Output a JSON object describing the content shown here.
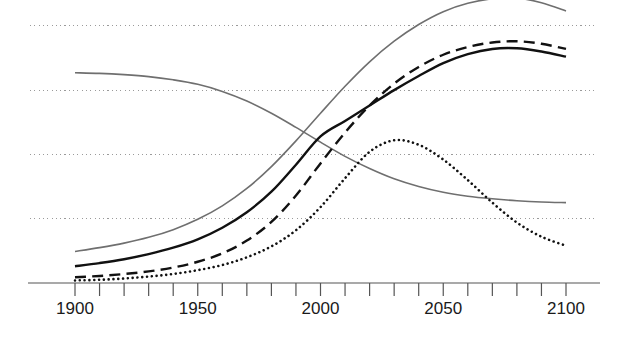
{
  "chart_data": {
    "type": "line",
    "title": "",
    "subtitle": "",
    "xlabel": "",
    "ylabel": "",
    "xlim": [
      1900,
      2100
    ],
    "ylim": [
      0,
      5
    ],
    "grid": "horizontal-dotted",
    "legend": "none",
    "x_ticks_major": [
      1900,
      1950,
      2000,
      2050,
      2100
    ],
    "x_tick_labels": [
      "1900",
      "1950",
      "2000",
      "2050",
      "2100"
    ],
    "x_ticks_minor_step": 10,
    "y_gridlines": [
      1,
      2,
      3,
      4
    ],
    "y_tick_labels": [],
    "colors": {
      "axis": "#555555",
      "grid": "#9a9a9a",
      "gray_line": "#6f6f6f",
      "black_line": "#111111",
      "background": "#ffffff"
    },
    "x": [
      1900,
      1910,
      1920,
      1930,
      1940,
      1950,
      1960,
      1970,
      1980,
      1990,
      2000,
      2010,
      2020,
      2030,
      2040,
      2050,
      2060,
      2070,
      2080,
      2090,
      2100
    ],
    "series": [
      {
        "name": "rising-gray-upper",
        "style": "solid",
        "color": "#6f6f6f",
        "width": 1.6,
        "values": [
          0.49,
          0.55,
          0.62,
          0.71,
          0.83,
          0.99,
          1.2,
          1.47,
          1.81,
          2.21,
          2.64,
          3.06,
          3.44,
          3.76,
          4.02,
          4.22,
          4.35,
          4.42,
          4.43,
          4.36,
          4.23
        ]
      },
      {
        "name": "declining-gray",
        "style": "solid",
        "color": "#6f6f6f",
        "width": 1.6,
        "values": [
          3.27,
          3.26,
          3.24,
          3.21,
          3.16,
          3.09,
          2.98,
          2.83,
          2.64,
          2.42,
          2.19,
          1.97,
          1.78,
          1.62,
          1.5,
          1.41,
          1.35,
          1.31,
          1.28,
          1.26,
          1.25
        ]
      },
      {
        "name": "solid-black",
        "style": "solid",
        "color": "#111111",
        "width": 2.4,
        "values": [
          0.26,
          0.31,
          0.37,
          0.45,
          0.55,
          0.68,
          0.86,
          1.1,
          1.42,
          1.84,
          2.28,
          2.52,
          2.76,
          3.0,
          3.22,
          3.42,
          3.56,
          3.64,
          3.65,
          3.6,
          3.52
        ]
      },
      {
        "name": "dashed-black",
        "style": "dashed",
        "color": "#111111",
        "width": 2.4,
        "values": [
          0.09,
          0.11,
          0.14,
          0.18,
          0.24,
          0.33,
          0.46,
          0.66,
          0.95,
          1.36,
          1.86,
          2.34,
          2.76,
          3.1,
          3.36,
          3.55,
          3.67,
          3.74,
          3.76,
          3.72,
          3.64
        ]
      },
      {
        "name": "dotted-black",
        "style": "dotted",
        "color": "#111111",
        "width": 2.6,
        "values": [
          0.04,
          0.05,
          0.07,
          0.1,
          0.14,
          0.2,
          0.28,
          0.4,
          0.57,
          0.82,
          1.18,
          1.63,
          2.04,
          2.22,
          2.15,
          1.92,
          1.6,
          1.25,
          0.94,
          0.72,
          0.58
        ]
      }
    ]
  },
  "axis": {
    "tick_labels": [
      {
        "text": "1900",
        "value": 1900
      },
      {
        "text": "1950",
        "value": 1950
      },
      {
        "text": "2000",
        "value": 2000
      },
      {
        "text": "2050",
        "value": 2050
      },
      {
        "text": "2100",
        "value": 2100
      }
    ]
  }
}
